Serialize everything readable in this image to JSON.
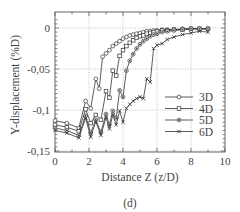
{
  "figure": {
    "caption": "(d)"
  },
  "chart_data": {
    "type": "line",
    "title": "",
    "xlabel": "Distance Z (z/D)",
    "ylabel": "Y-displacement (%D)",
    "xlim": [
      0,
      10
    ],
    "ylim": [
      -0.15,
      0.01
    ],
    "x_ticks": [
      0,
      2,
      4,
      6,
      8,
      10
    ],
    "x_tick_labels": [
      "0",
      "2",
      "4",
      "6",
      "8",
      "10"
    ],
    "y_ticks": [
      0,
      -0.05,
      -0.1,
      -0.15
    ],
    "y_tick_labels": [
      "0",
      "-0,05",
      "-0,1",
      "-0,15"
    ],
    "grid": "dotted at major ticks",
    "legend_position": "lower right",
    "series": [
      {
        "name": "3D",
        "marker": "circle",
        "x": [
          0,
          0.7,
          1.4,
          1.8,
          2.1,
          2.4,
          2.6,
          2.8,
          3.0,
          3.2,
          3.4,
          3.6,
          3.8,
          4.0,
          4.2,
          4.4,
          4.6,
          4.8,
          5.0,
          5.2,
          5.4,
          5.6,
          5.8,
          6.0,
          6.3,
          6.6,
          7.0,
          7.5,
          8.0,
          8.5,
          9.0
        ],
        "y": [
          -0.113,
          -0.116,
          -0.122,
          -0.089,
          -0.098,
          -0.062,
          -0.074,
          -0.035,
          -0.031,
          -0.027,
          -0.022,
          -0.019,
          -0.016,
          -0.013,
          -0.011,
          -0.009,
          -0.008,
          -0.007,
          -0.006,
          -0.005,
          -0.004,
          -0.004,
          -0.003,
          -0.003,
          -0.002,
          -0.002,
          -0.002,
          -0.001,
          -0.001,
          -0.001,
          -0.001
        ]
      },
      {
        "name": "4D",
        "marker": "square",
        "x": [
          0,
          0.7,
          1.4,
          1.8,
          2.1,
          2.4,
          2.7,
          3.0,
          3.2,
          3.4,
          3.6,
          3.8,
          4.0,
          4.2,
          4.4,
          4.6,
          4.8,
          5.0,
          5.2,
          5.4,
          5.6,
          5.8,
          6.0,
          6.3,
          6.6,
          7.0,
          7.5,
          8.0,
          8.5,
          9.0
        ],
        "y": [
          -0.118,
          -0.121,
          -0.126,
          -0.099,
          -0.116,
          -0.106,
          -0.112,
          -0.077,
          -0.085,
          -0.052,
          -0.058,
          -0.034,
          -0.027,
          -0.022,
          -0.018,
          -0.015,
          -0.012,
          -0.01,
          -0.009,
          -0.007,
          -0.006,
          -0.005,
          -0.004,
          -0.003,
          -0.003,
          -0.002,
          -0.002,
          -0.001,
          -0.001,
          -0.001
        ]
      },
      {
        "name": "5D",
        "marker": "filled-circle",
        "x": [
          0,
          0.7,
          1.4,
          1.8,
          2.1,
          2.4,
          2.7,
          3.0,
          3.2,
          3.4,
          3.6,
          3.8,
          4.0,
          4.2,
          4.4,
          4.6,
          4.8,
          5.0,
          5.2,
          5.4,
          5.6,
          5.8,
          6.0,
          6.3,
          6.6,
          7.0,
          7.5,
          8.0,
          8.5,
          9.0
        ],
        "y": [
          -0.122,
          -0.125,
          -0.131,
          -0.107,
          -0.128,
          -0.112,
          -0.127,
          -0.105,
          -0.118,
          -0.101,
          -0.11,
          -0.076,
          -0.084,
          -0.052,
          -0.04,
          -0.032,
          -0.025,
          -0.02,
          -0.016,
          -0.013,
          -0.01,
          -0.008,
          -0.007,
          -0.005,
          -0.004,
          -0.003,
          -0.002,
          -0.001,
          -0.001,
          -0.001
        ]
      },
      {
        "name": "6D",
        "marker": "x",
        "x": [
          0,
          0.7,
          1.4,
          1.8,
          2.1,
          2.4,
          2.7,
          3.0,
          3.2,
          3.4,
          3.6,
          3.8,
          4.0,
          4.2,
          4.4,
          4.6,
          4.8,
          5.0,
          5.2,
          5.4,
          5.6,
          5.8,
          6.0,
          6.3,
          6.6,
          7.0,
          7.5,
          8.0,
          8.5,
          9.0
        ],
        "y": [
          -0.125,
          -0.128,
          -0.134,
          -0.11,
          -0.133,
          -0.114,
          -0.131,
          -0.109,
          -0.123,
          -0.106,
          -0.118,
          -0.101,
          -0.115,
          -0.098,
          -0.093,
          -0.089,
          -0.086,
          -0.084,
          -0.086,
          -0.062,
          -0.066,
          -0.025,
          -0.021,
          -0.019,
          -0.014,
          -0.011,
          -0.008,
          -0.006,
          -0.004,
          -0.005
        ]
      }
    ]
  }
}
